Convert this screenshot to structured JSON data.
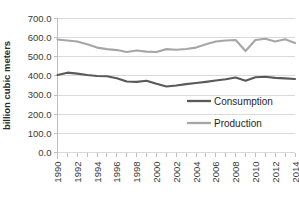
{
  "chart_data": {
    "type": "line",
    "title": "",
    "xlabel": "",
    "ylabel": "billion cubic meters",
    "ylim": [
      0,
      700
    ],
    "ytick_labels": [
      "0.0",
      "100.0",
      "200.0",
      "300.0",
      "400.0",
      "500.0",
      "600.0",
      "700.0"
    ],
    "ytick_values": [
      0,
      100,
      200,
      300,
      400,
      500,
      600,
      700
    ],
    "grid": true,
    "legend_position": "inside-right",
    "x": [
      1990,
      1991,
      1992,
      1993,
      1994,
      1995,
      1996,
      1997,
      1998,
      1999,
      2000,
      2001,
      2002,
      2003,
      2004,
      2005,
      2006,
      2007,
      2008,
      2009,
      2010,
      2011,
      2012,
      2013,
      2014
    ],
    "xtick_labels": [
      "1990",
      "1992",
      "1994",
      "1996",
      "1998",
      "2000",
      "2002",
      "2004",
      "2006",
      "2008",
      "2010",
      "2012",
      "2014"
    ],
    "xtick_values": [
      1990,
      1992,
      1994,
      1996,
      1998,
      2000,
      2002,
      2004,
      2006,
      2008,
      2010,
      2012,
      2014
    ],
    "series": [
      {
        "name": "Consumption",
        "color": "#595959",
        "values": [
          405,
          417,
          412,
          405,
          400,
          398,
          388,
          371,
          369,
          375,
          359,
          345,
          350,
          357,
          363,
          369,
          376,
          383,
          392,
          375,
          393,
          396,
          390,
          387,
          384
        ]
      },
      {
        "name": "Production",
        "color": "#a6a6a6",
        "values": [
          590,
          585,
          580,
          565,
          548,
          540,
          535,
          525,
          533,
          527,
          525,
          540,
          537,
          541,
          548,
          565,
          580,
          585,
          588,
          530,
          588,
          594,
          580,
          592,
          572
        ]
      }
    ]
  },
  "legend": {
    "items": [
      {
        "label": "Consumption",
        "color": "#595959"
      },
      {
        "label": "Production",
        "color": "#a6a6a6"
      }
    ]
  },
  "axes": {
    "y_axis_title": "billion cubic meters"
  }
}
